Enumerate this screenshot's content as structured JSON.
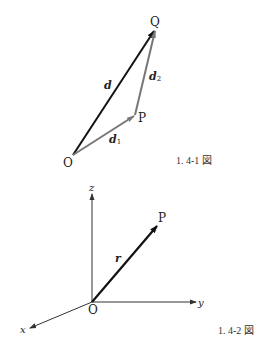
{
  "figure1": {
    "caption": "1. 4-1 図",
    "points": {
      "O": {
        "label": "O",
        "x": 73,
        "y": 155
      },
      "P": {
        "label": "P",
        "x": 135,
        "y": 116
      },
      "Q": {
        "label": "Q",
        "x": 155,
        "y": 30
      }
    },
    "vectors": [
      {
        "name": "d",
        "label": "d",
        "subscript": "",
        "from": "O",
        "to": "Q",
        "color": "#111111"
      },
      {
        "name": "d1",
        "label": "d",
        "subscript": "1",
        "from": "O",
        "to": "P",
        "color": "#777777"
      },
      {
        "name": "d2",
        "label": "d",
        "subscript": "2",
        "from": "P",
        "to": "Q",
        "color": "#777777"
      }
    ]
  },
  "figure2": {
    "caption": "1. 4-2 図",
    "origin_label": "O",
    "axes": {
      "x": {
        "label": "x"
      },
      "y": {
        "label": "y"
      },
      "z": {
        "label": "z"
      }
    },
    "point": {
      "label": "P"
    },
    "vector": {
      "label": "r",
      "color": "#111111"
    }
  }
}
